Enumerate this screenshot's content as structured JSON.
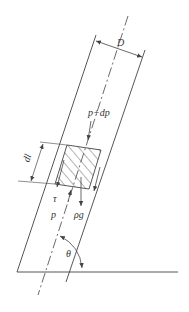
{
  "diagram": {
    "type": "inclined-pipe-force-balance",
    "labels": {
      "diameter": "D",
      "pressure_top": "p+dp",
      "element_length": "dl",
      "shear_stress": "τ",
      "pressure_bottom": "p",
      "weight": "ρg",
      "angle": "θ"
    },
    "colors": {
      "line": "#444444",
      "background": "#ffffff"
    }
  }
}
